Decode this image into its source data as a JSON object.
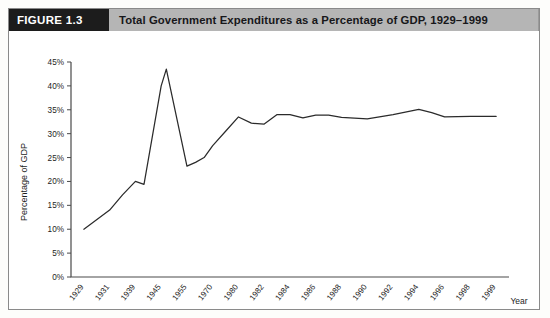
{
  "figure": {
    "number_label": "FIGURE 1.3",
    "title": "Total Government Expenditures as a Percentage of GDP, 1929–1999"
  },
  "chart_data": {
    "type": "line",
    "title": "Total Government Expenditures as a Percentage of GDP, 1929–1999",
    "xlabel": "Year",
    "ylabel": "Percentage of GDP",
    "ylim": [
      0,
      45
    ],
    "ytick_labels": [
      "0%",
      "5%",
      "10%",
      "15%",
      "20%",
      "25%",
      "30%",
      "35%",
      "40%",
      "45%"
    ],
    "ytick_values": [
      0,
      5,
      10,
      15,
      20,
      25,
      30,
      35,
      40,
      45
    ],
    "xtick_labels": [
      "1929",
      "1931",
      "1939",
      "1945",
      "1955",
      "1970",
      "1980",
      "1982",
      "1984",
      "1986",
      "1988",
      "1990",
      "1992",
      "1994",
      "1996",
      "1998",
      "1999"
    ],
    "grid": false,
    "legend": false,
    "series": [
      {
        "name": "Total Government Expenditures as a Percentage of GDP",
        "points": [
          {
            "x": "1929",
            "y": 10.0
          },
          {
            "x": "1931",
            "y": 14.0
          },
          {
            "x": "1935",
            "y": 17.2
          },
          {
            "x": "1939",
            "y": 20.0
          },
          {
            "x": "1941",
            "y": 19.4
          },
          {
            "x": "1945",
            "y": 40.0
          },
          {
            "x": "1947",
            "y": 43.5
          },
          {
            "x": "1955",
            "y": 23.2
          },
          {
            "x": "1960",
            "y": 24.0
          },
          {
            "x": "1965",
            "y": 25.0
          },
          {
            "x": "1970",
            "y": 27.5
          },
          {
            "x": "1975",
            "y": 30.5
          },
          {
            "x": "1980",
            "y": 33.5
          },
          {
            "x": "1981",
            "y": 32.2
          },
          {
            "x": "1982",
            "y": 32.0
          },
          {
            "x": "1983",
            "y": 34.0
          },
          {
            "x": "1984",
            "y": 34.0
          },
          {
            "x": "1985",
            "y": 33.3
          },
          {
            "x": "1986",
            "y": 33.9
          },
          {
            "x": "1987",
            "y": 33.9
          },
          {
            "x": "1988",
            "y": 33.4
          },
          {
            "x": "1990",
            "y": 33.1
          },
          {
            "x": "1992",
            "y": 34.0
          },
          {
            "x": "1994",
            "y": 35.1
          },
          {
            "x": "1995",
            "y": 34.4
          },
          {
            "x": "1996",
            "y": 33.5
          },
          {
            "x": "1998",
            "y": 33.6
          },
          {
            "x": "1999",
            "y": 33.6
          }
        ]
      }
    ]
  },
  "colors": {
    "figure_number_bg": "#1c1c1c",
    "figure_title_bg": "#b5b5b5",
    "line": "#2b2b2b",
    "axis": "#4a4a4a",
    "frame": "#8a8a8a"
  }
}
